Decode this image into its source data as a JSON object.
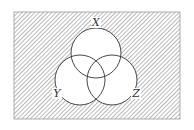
{
  "diagram": {
    "type": "venn",
    "universe": {
      "x": 14,
      "y": 12,
      "width": 166,
      "height": 107,
      "hatched": true
    },
    "hatch_color": "#8a8a8a",
    "outline_color": "#333333",
    "shaded_region": "complement of (X ∪ Y ∪ Z)",
    "sets": [
      {
        "label": "X",
        "cx": 96,
        "cy": 53,
        "r": 25,
        "label_x": 96,
        "label_y": 26
      },
      {
        "label": "Y",
        "cx": 80,
        "cy": 80,
        "r": 25,
        "label_x": 57,
        "label_y": 97
      },
      {
        "label": "Z",
        "cx": 112,
        "cy": 80,
        "r": 25,
        "label_x": 136,
        "label_y": 97
      }
    ]
  }
}
